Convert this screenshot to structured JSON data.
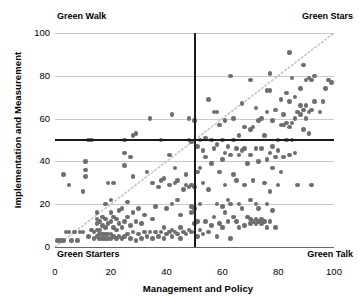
{
  "chart_data": {
    "type": "scatter",
    "title": "",
    "xlabel": "Management and Policy",
    "ylabel": "Implementation and Measurement",
    "xlim": [
      0,
      100
    ],
    "ylim": [
      0,
      100
    ],
    "xticks": [
      0,
      20,
      40,
      60,
      80,
      100
    ],
    "yticks": [
      0,
      20,
      40,
      60,
      80,
      100
    ],
    "xtick_labels": [
      "0",
      "20",
      "40",
      "60",
      "80",
      "100"
    ],
    "ytick_labels": [
      "0",
      "20",
      "40",
      "60",
      "80",
      "100"
    ],
    "grid": "horizontal",
    "legend": "none",
    "marker_color": "#6e6e6e",
    "reference_lines": [
      {
        "name": "median-vertical",
        "orientation": "vertical",
        "value": 50,
        "style": "solid",
        "color": "#1a1a1a"
      },
      {
        "name": "median-horizontal",
        "orientation": "horizontal",
        "value": 50,
        "style": "solid",
        "color": "#1a1a1a"
      },
      {
        "name": "identity-diagonal",
        "orientation": "diagonal",
        "from": [
          0,
          0
        ],
        "to": [
          100,
          100
        ],
        "style": "dotted",
        "color": "#c4c4c4"
      }
    ],
    "quadrant_labels": {
      "top_left": "Green Walk",
      "top_right": "Green Stars",
      "bottom_left": "Green Starters",
      "bottom_right": "Green Talk"
    },
    "points": [
      [
        1,
        3
      ],
      [
        2,
        3
      ],
      [
        3,
        3
      ],
      [
        3,
        34
      ],
      [
        4,
        7
      ],
      [
        5,
        7
      ],
      [
        5,
        29
      ],
      [
        6,
        3
      ],
      [
        7,
        7
      ],
      [
        8,
        3
      ],
      [
        9,
        7
      ],
      [
        10,
        7
      ],
      [
        10,
        26
      ],
      [
        11,
        33
      ],
      [
        11,
        40
      ],
      [
        11,
        36
      ],
      [
        12,
        50
      ],
      [
        12,
        5
      ],
      [
        13,
        50
      ],
      [
        13,
        8
      ],
      [
        14,
        4
      ],
      [
        14,
        7
      ],
      [
        15,
        5
      ],
      [
        15,
        8
      ],
      [
        15,
        11
      ],
      [
        15,
        13
      ],
      [
        15,
        16
      ],
      [
        16,
        4
      ],
      [
        16,
        6
      ],
      [
        16,
        8
      ],
      [
        16,
        12
      ],
      [
        17,
        4
      ],
      [
        17,
        6
      ],
      [
        17,
        10
      ],
      [
        17,
        14
      ],
      [
        18,
        4
      ],
      [
        18,
        6
      ],
      [
        18,
        9
      ],
      [
        18,
        13
      ],
      [
        18,
        20
      ],
      [
        19,
        4
      ],
      [
        19,
        6
      ],
      [
        19,
        11
      ],
      [
        19,
        30
      ],
      [
        20,
        4
      ],
      [
        20,
        6
      ],
      [
        20,
        12
      ],
      [
        20,
        16
      ],
      [
        20,
        22
      ],
      [
        21,
        5
      ],
      [
        21,
        9
      ],
      [
        21,
        14
      ],
      [
        21,
        30
      ],
      [
        22,
        4
      ],
      [
        22,
        8
      ],
      [
        22,
        13
      ],
      [
        23,
        5
      ],
      [
        23,
        11
      ],
      [
        23,
        17
      ],
      [
        24,
        4
      ],
      [
        24,
        9
      ],
      [
        24,
        18
      ],
      [
        25,
        5
      ],
      [
        25,
        12
      ],
      [
        25,
        38
      ],
      [
        25,
        44
      ],
      [
        25,
        50
      ],
      [
        26,
        6
      ],
      [
        26,
        14
      ],
      [
        26,
        21
      ],
      [
        27,
        4
      ],
      [
        27,
        10
      ],
      [
        27,
        42
      ],
      [
        28,
        7
      ],
      [
        28,
        16
      ],
      [
        28,
        33
      ],
      [
        28,
        52
      ],
      [
        29,
        3
      ],
      [
        29,
        12
      ],
      [
        29,
        53
      ],
      [
        30,
        6
      ],
      [
        30,
        18
      ],
      [
        31,
        4
      ],
      [
        31,
        11
      ],
      [
        32,
        7
      ],
      [
        32,
        15
      ],
      [
        33,
        5
      ],
      [
        33,
        35
      ],
      [
        34,
        7
      ],
      [
        34,
        60
      ],
      [
        35,
        4
      ],
      [
        35,
        13
      ],
      [
        35,
        30
      ],
      [
        36,
        7
      ],
      [
        36,
        19
      ],
      [
        37,
        5
      ],
      [
        37,
        28
      ],
      [
        38,
        7
      ],
      [
        38,
        31
      ],
      [
        38,
        50
      ],
      [
        39,
        4
      ],
      [
        39,
        9
      ],
      [
        39,
        32
      ],
      [
        40,
        6
      ],
      [
        40,
        18
      ],
      [
        41,
        7
      ],
      [
        41,
        29
      ],
      [
        41,
        43
      ],
      [
        42,
        5
      ],
      [
        42,
        8
      ],
      [
        42,
        20
      ],
      [
        42,
        62
      ],
      [
        43,
        7
      ],
      [
        43,
        30
      ],
      [
        43,
        37
      ],
      [
        44,
        6
      ],
      [
        44,
        22
      ],
      [
        44,
        31
      ],
      [
        45,
        4
      ],
      [
        45,
        9
      ],
      [
        45,
        15
      ],
      [
        46,
        7
      ],
      [
        46,
        27
      ],
      [
        47,
        6
      ],
      [
        47,
        29
      ],
      [
        47,
        34
      ],
      [
        48,
        8
      ],
      [
        48,
        28
      ],
      [
        48,
        50
      ],
      [
        48,
        60
      ],
      [
        49,
        7
      ],
      [
        49,
        16
      ],
      [
        49,
        19
      ],
      [
        49,
        29
      ],
      [
        49,
        49
      ],
      [
        50,
        11
      ],
      [
        50,
        18
      ],
      [
        50,
        28
      ],
      [
        50,
        59
      ],
      [
        51,
        5
      ],
      [
        51,
        12
      ],
      [
        51,
        35
      ],
      [
        51,
        47
      ],
      [
        52,
        8
      ],
      [
        52,
        20
      ],
      [
        52,
        37
      ],
      [
        52,
        50
      ],
      [
        53,
        6
      ],
      [
        53,
        30
      ],
      [
        53,
        45
      ],
      [
        54,
        12
      ],
      [
        54,
        42
      ],
      [
        54,
        51
      ],
      [
        55,
        7
      ],
      [
        55,
        27
      ],
      [
        55,
        69
      ],
      [
        56,
        10
      ],
      [
        56,
        39
      ],
      [
        56,
        50
      ],
      [
        57,
        14
      ],
      [
        57,
        46
      ],
      [
        57,
        63
      ],
      [
        58,
        5
      ],
      [
        58,
        20
      ],
      [
        58,
        48
      ],
      [
        58,
        63
      ],
      [
        59,
        11
      ],
      [
        59,
        35
      ],
      [
        59,
        57
      ],
      [
        60,
        9
      ],
      [
        60,
        19
      ],
      [
        60,
        41
      ],
      [
        60,
        50
      ],
      [
        61,
        16
      ],
      [
        61,
        29
      ],
      [
        61,
        44
      ],
      [
        61,
        59
      ],
      [
        62,
        12
      ],
      [
        62,
        22
      ],
      [
        62,
        47
      ],
      [
        63,
        4
      ],
      [
        63,
        20
      ],
      [
        63,
        43
      ],
      [
        63,
        80
      ],
      [
        64,
        14
      ],
      [
        64,
        34
      ],
      [
        64,
        50
      ],
      [
        64,
        60
      ],
      [
        65,
        12
      ],
      [
        65,
        31
      ],
      [
        65,
        46
      ],
      [
        66,
        9
      ],
      [
        66,
        20
      ],
      [
        66,
        43
      ],
      [
        66,
        52
      ],
      [
        67,
        18
      ],
      [
        67,
        45
      ],
      [
        67,
        67
      ],
      [
        68,
        10
      ],
      [
        68,
        29
      ],
      [
        68,
        46
      ],
      [
        68,
        56
      ],
      [
        69,
        14
      ],
      [
        69,
        39
      ],
      [
        70,
        11
      ],
      [
        70,
        13
      ],
      [
        70,
        22
      ],
      [
        70,
        43
      ],
      [
        70,
        55
      ],
      [
        70,
        78
      ],
      [
        71,
        12
      ],
      [
        71,
        31
      ],
      [
        71,
        56
      ],
      [
        72,
        11
      ],
      [
        72,
        13
      ],
      [
        72,
        20
      ],
      [
        72,
        46
      ],
      [
        72,
        65
      ],
      [
        73,
        12
      ],
      [
        73,
        18
      ],
      [
        73,
        40
      ],
      [
        73,
        59
      ],
      [
        74,
        11
      ],
      [
        74,
        13
      ],
      [
        74,
        46
      ],
      [
        74,
        60
      ],
      [
        75,
        12
      ],
      [
        75,
        30
      ],
      [
        75,
        52
      ],
      [
        76,
        9
      ],
      [
        76,
        20
      ],
      [
        76,
        41
      ],
      [
        76,
        63
      ],
      [
        76,
        73
      ],
      [
        77,
        12
      ],
      [
        77,
        26
      ],
      [
        77,
        44
      ],
      [
        77,
        73
      ],
      [
        77,
        81
      ],
      [
        78,
        17
      ],
      [
        78,
        37
      ],
      [
        78,
        47
      ],
      [
        78,
        59
      ],
      [
        79,
        9
      ],
      [
        79,
        42
      ],
      [
        79,
        64
      ],
      [
        80,
        29
      ],
      [
        80,
        45
      ],
      [
        80,
        50
      ],
      [
        81,
        35
      ],
      [
        81,
        57
      ],
      [
        81,
        69
      ],
      [
        82,
        42
      ],
      [
        82,
        57
      ],
      [
        82,
        62
      ],
      [
        83,
        50
      ],
      [
        83,
        58
      ],
      [
        83,
        72
      ],
      [
        84,
        43
      ],
      [
        84,
        56
      ],
      [
        84,
        68
      ],
      [
        84,
        91
      ],
      [
        85,
        50
      ],
      [
        85,
        58
      ],
      [
        85,
        79
      ],
      [
        86,
        44
      ],
      [
        86,
        60
      ],
      [
        86,
        70
      ],
      [
        87,
        29
      ],
      [
        87,
        63
      ],
      [
        88,
        62
      ],
      [
        88,
        66
      ],
      [
        88,
        74
      ],
      [
        89,
        55
      ],
      [
        89,
        64
      ],
      [
        89,
        85
      ],
      [
        90,
        60
      ],
      [
        90,
        66
      ],
      [
        90,
        78
      ],
      [
        91,
        53
      ],
      [
        91,
        63
      ],
      [
        91,
        79
      ],
      [
        92,
        29
      ],
      [
        92,
        64
      ],
      [
        92,
        78
      ],
      [
        93,
        68
      ],
      [
        93,
        80
      ],
      [
        95,
        63
      ],
      [
        96,
        68
      ],
      [
        97,
        74
      ],
      [
        98,
        78
      ],
      [
        99,
        77
      ]
    ]
  }
}
